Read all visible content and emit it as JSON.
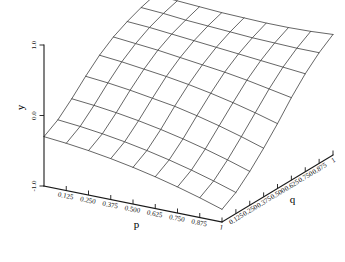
{
  "chart_data": {
    "type": "surface",
    "title": "",
    "subtitle": "",
    "xlabel": "p",
    "ylabel": "q",
    "zlabel": "y",
    "grid": false,
    "legend": "none",
    "x": [
      0.0,
      0.125,
      0.25,
      0.375,
      0.5,
      0.625,
      0.75,
      0.875,
      1.0
    ],
    "y": [
      0.0,
      0.125,
      0.25,
      0.375,
      0.5,
      0.625,
      0.75,
      0.875,
      1.0
    ],
    "xtick_labels": [
      "0.125",
      "0.250",
      "0.375",
      "0.500",
      "0.625",
      "0.750",
      "0.875",
      "1"
    ],
    "xtick_values": [
      0.125,
      0.25,
      0.375,
      0.5,
      0.625,
      0.75,
      0.875,
      1.0
    ],
    "ytick_labels": [
      "0.125",
      "0.250",
      "0.375",
      "0.500",
      "0.625",
      "0.750",
      "0.875",
      "1"
    ],
    "ytick_values": [
      0.125,
      0.25,
      0.375,
      0.5,
      0.625,
      0.75,
      0.875,
      1.0
    ],
    "ztick_labels": [
      "1.0",
      "0.0",
      "-1.0"
    ],
    "ztick_values": [
      1.0,
      0.0,
      -1.0
    ],
    "xlim": [
      0.0,
      1.0
    ],
    "ylim": [
      0.0,
      1.0
    ],
    "zlim": [
      -1.0,
      1.0
    ],
    "z": [
      [
        -0.3,
        -0.18,
        0.0,
        0.2,
        0.38,
        0.52,
        0.62,
        0.7,
        0.76
      ],
      [
        -0.33,
        -0.21,
        -0.03,
        0.17,
        0.35,
        0.49,
        0.6,
        0.68,
        0.74
      ],
      [
        -0.37,
        -0.25,
        -0.07,
        0.13,
        0.31,
        0.46,
        0.57,
        0.65,
        0.72
      ],
      [
        -0.42,
        -0.3,
        -0.12,
        0.08,
        0.27,
        0.42,
        0.54,
        0.63,
        0.7
      ],
      [
        -0.48,
        -0.36,
        -0.18,
        0.03,
        0.22,
        0.38,
        0.51,
        0.61,
        0.69
      ],
      [
        -0.55,
        -0.43,
        -0.25,
        -0.04,
        0.16,
        0.34,
        0.48,
        0.59,
        0.68
      ],
      [
        -0.63,
        -0.51,
        -0.33,
        -0.12,
        0.09,
        0.29,
        0.45,
        0.58,
        0.68
      ],
      [
        -0.72,
        -0.6,
        -0.42,
        -0.21,
        0.01,
        0.23,
        0.42,
        0.57,
        0.69
      ],
      [
        -0.82,
        -0.7,
        -0.52,
        -0.31,
        -0.08,
        0.17,
        0.39,
        0.57,
        0.71
      ]
    ],
    "projection": {
      "origin_x": 44,
      "origin_y": 186,
      "p_axis_end_x": 222,
      "p_axis_end_y": 222,
      "q_axis_end_x": 333,
      "q_axis_end_y": 155,
      "z_axis_top_y": 45,
      "z_axis_bottom_y": 186
    },
    "colors": {
      "mesh": "#333333",
      "axis": "#1a1a1a",
      "background": "#ffffff",
      "text": "#111111"
    }
  },
  "labels": {
    "x_axis_title": "p",
    "y_axis_title": "q",
    "z_axis_title": "y"
  }
}
